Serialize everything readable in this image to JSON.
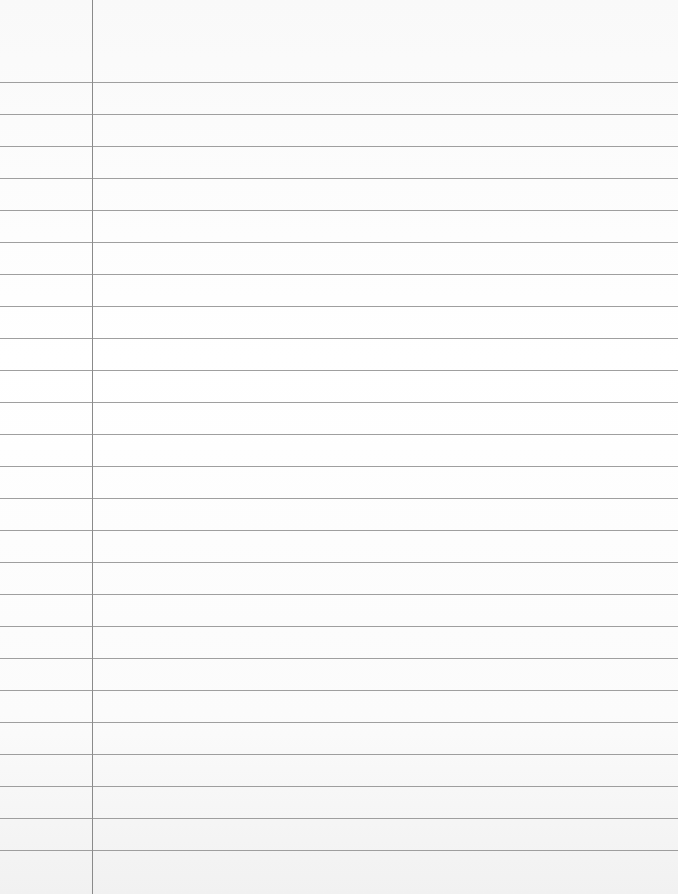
{
  "paper": {
    "type": "ruled notebook paper",
    "background_color": "#ffffff",
    "rule_color": "#8e8e8e",
    "margin_line_color": "#8a8a8a",
    "margin_x": 92,
    "first_rule_y": 82,
    "rule_spacing": 32,
    "rule_count": 25,
    "text": ""
  }
}
